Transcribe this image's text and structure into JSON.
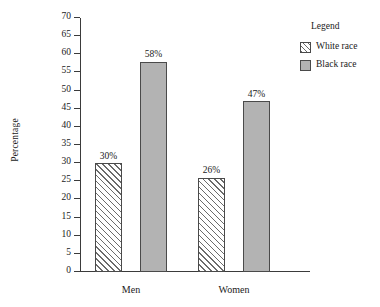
{
  "chart_data": {
    "type": "bar",
    "title": "",
    "subtitle": "",
    "xlabel": "",
    "ylabel": "Percentage",
    "categories": [
      "Men",
      "Women"
    ],
    "series": [
      {
        "name": "White race",
        "values": [
          30,
          26
        ],
        "fill": "hatch",
        "color": "#ffffff"
      },
      {
        "name": "Black race",
        "values": [
          58,
          47
        ],
        "fill": "solid",
        "color": "#b3b3b3"
      }
    ],
    "data_labels": [
      "30%",
      "58%",
      "26%",
      "47%"
    ],
    "ylim": [
      0,
      70
    ],
    "ytick_step": 5,
    "yticks": [
      0,
      5,
      10,
      15,
      20,
      25,
      30,
      35,
      40,
      45,
      50,
      55,
      60,
      65,
      70
    ],
    "ytick_labels": [
      "0",
      "5",
      "10",
      "15",
      "20",
      "25",
      "30",
      "35",
      "40",
      "45",
      "50",
      "55",
      "60",
      "65",
      "70"
    ],
    "grid": false,
    "legend_position": "top-right",
    "legend_title": "Legend",
    "legend_entries": [
      "White race",
      "Black race"
    ],
    "background_color": "#ffffff",
    "axis_color": "#3b3b3b"
  },
  "legend": {
    "title": "Legend",
    "items": [
      {
        "label": "White race",
        "swatch": "hatch-swatch-icon"
      },
      {
        "label": "Black race",
        "swatch": "solid-gray-swatch-icon"
      }
    ]
  },
  "axes": {
    "y_title": "Percentage"
  }
}
